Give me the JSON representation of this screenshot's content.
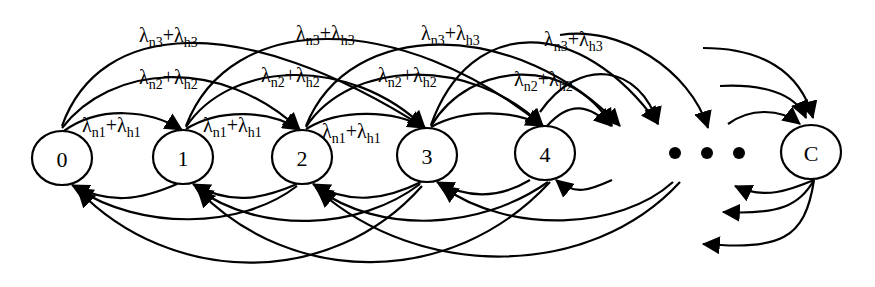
{
  "diagram": {
    "type": "state-transition-diagram",
    "nodes": [
      {
        "id": "0",
        "label": "0",
        "cx": 62,
        "cy": 158
      },
      {
        "id": "1",
        "label": "1",
        "cx": 183,
        "cy": 157
      },
      {
        "id": "2",
        "label": "2",
        "cx": 302,
        "cy": 157
      },
      {
        "id": "3",
        "label": "3",
        "cx": 427,
        "cy": 155
      },
      {
        "id": "4",
        "label": "4",
        "cx": 545,
        "cy": 153
      },
      {
        "id": "C",
        "label": "C",
        "cx": 811,
        "cy": 152
      }
    ],
    "ellipsis": "• • •",
    "rate_labels": {
      "step1": {
        "lambda": "λ",
        "a_sub": "n1",
        "plus": "+",
        "b_sub": "h1",
        "text": "λn1+λh1"
      },
      "step2": {
        "lambda": "λ",
        "a_sub": "n2",
        "plus": "+",
        "b_sub": "h2",
        "text": "λn2+λh2"
      },
      "step3": {
        "lambda": "λ",
        "a_sub": "n3",
        "plus": "+",
        "b_sub": "h3",
        "text": "λn3+λh3"
      }
    },
    "forward_edges": [
      {
        "from": "0",
        "to": "1",
        "rate": "step1"
      },
      {
        "from": "0",
        "to": "2",
        "rate": "step2"
      },
      {
        "from": "0",
        "to": "3",
        "rate": "step3"
      },
      {
        "from": "1",
        "to": "2",
        "rate": "step1"
      },
      {
        "from": "1",
        "to": "3",
        "rate": "step2"
      },
      {
        "from": "1",
        "to": "4",
        "rate": "step3"
      },
      {
        "from": "2",
        "to": "3",
        "rate": "step1"
      },
      {
        "from": "2",
        "to": "4",
        "rate": "step2"
      },
      {
        "from": "2",
        "to": "…",
        "rate": "step3"
      },
      {
        "from": "3",
        "to": "4",
        "rate": "step1"
      },
      {
        "from": "3",
        "to": "…",
        "rate": "step2"
      },
      {
        "from": "3",
        "to": "…",
        "rate": "step3"
      },
      {
        "from": "4",
        "to": "…",
        "rate": "step1"
      },
      {
        "from": "4",
        "to": "…",
        "rate": "step2"
      },
      {
        "from": "4",
        "to": "…",
        "rate": "step3"
      },
      {
        "from": "…",
        "to": "C",
        "rate": "step1"
      },
      {
        "from": "…",
        "to": "C",
        "rate": "step2"
      },
      {
        "from": "…",
        "to": "C",
        "rate": "step3"
      }
    ],
    "backward_edges": [
      {
        "from": "1",
        "to": "0"
      },
      {
        "from": "2",
        "to": "1"
      },
      {
        "from": "2",
        "to": "0"
      },
      {
        "from": "3",
        "to": "2"
      },
      {
        "from": "3",
        "to": "1"
      },
      {
        "from": "3",
        "to": "0"
      },
      {
        "from": "4",
        "to": "3"
      },
      {
        "from": "4",
        "to": "2"
      },
      {
        "from": "4",
        "to": "1"
      },
      {
        "from": "…",
        "to": "4"
      },
      {
        "from": "…",
        "to": "3"
      },
      {
        "from": "…",
        "to": "2"
      },
      {
        "from": "C",
        "to": "…"
      },
      {
        "from": "C",
        "to": "…"
      },
      {
        "from": "C",
        "to": "…"
      }
    ]
  }
}
